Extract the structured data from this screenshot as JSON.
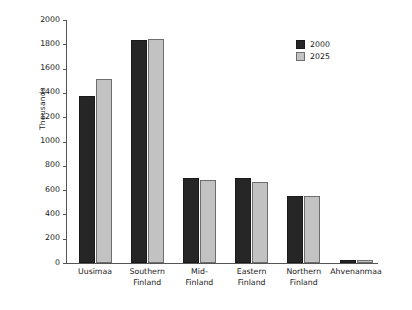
{
  "chart_data": {
    "type": "bar",
    "title": "",
    "subtitle": "",
    "xlabel": "",
    "ylabel": "Thousands",
    "ylim": [
      0,
      2000
    ],
    "ytick_step": 200,
    "yticks": [
      "2000",
      "1800",
      "1600",
      "1400",
      "1200",
      "1000",
      "800",
      "600",
      "400",
      "200",
      "0"
    ],
    "grid": false,
    "legend_position": "top-right",
    "categories": [
      "Uusimaa",
      "Southern\nFinland",
      "Mid-\nFinland",
      "Eastern\nFinland",
      "Northern\nFinland",
      "Ahvenanmaa"
    ],
    "series": [
      {
        "name": "2000",
        "color": "#262626",
        "values": [
          1374,
          1835,
          700,
          700,
          551,
          26
        ]
      },
      {
        "name": "2025",
        "color": "#c2c2c2",
        "values": [
          1514,
          1840,
          683,
          667,
          551,
          28
        ]
      }
    ]
  },
  "legend": {
    "items": [
      {
        "label": "2000"
      },
      {
        "label": "2025"
      }
    ]
  }
}
